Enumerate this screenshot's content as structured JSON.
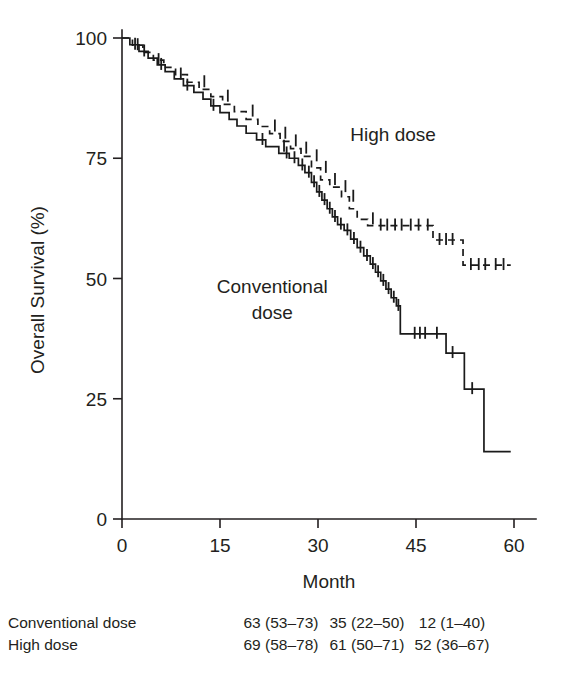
{
  "chart_data": {
    "type": "line",
    "title": "",
    "xlabel": "Month",
    "ylabel": "Overall Survival (%)",
    "xlim": [
      0,
      60
    ],
    "ylim": [
      0,
      100
    ],
    "xticks": [
      0,
      15,
      30,
      45,
      60
    ],
    "xtick_labels": [
      "0",
      "15",
      "30",
      "45",
      "60"
    ],
    "yticks": [
      0,
      25,
      50,
      75,
      100
    ],
    "ytick_labels": [
      "0",
      "25",
      "50",
      "75",
      "100"
    ],
    "grid": false,
    "legend_position": "inline-annotations",
    "annotations": [
      {
        "name": "high-dose-label",
        "text": "High dose",
        "x": 41.5,
        "y": 78.5
      },
      {
        "name": "conventional-dose-label",
        "text": "Conventional",
        "x": 23.0,
        "y": 47.0
      },
      {
        "name": "conventional-dose-label-line2",
        "text": "dose",
        "x": 23.0,
        "y": 41.5
      }
    ],
    "series": [
      {
        "name": "Conventional dose",
        "style": "solid",
        "points": [
          [
            0,
            100
          ],
          [
            1.2,
            100
          ],
          [
            1.2,
            98.6
          ],
          [
            2.6,
            98.6
          ],
          [
            2.6,
            97.2
          ],
          [
            4.0,
            97.2
          ],
          [
            4.0,
            95.8
          ],
          [
            5.4,
            95.8
          ],
          [
            5.4,
            94.4
          ],
          [
            6.6,
            94.4
          ],
          [
            6.6,
            93.0
          ],
          [
            8.0,
            93.0
          ],
          [
            8.0,
            91.5
          ],
          [
            9.4,
            91.5
          ],
          [
            9.4,
            90.1
          ],
          [
            11.0,
            90.1
          ],
          [
            11.0,
            88.7
          ],
          [
            12.4,
            88.7
          ],
          [
            12.4,
            87.3
          ],
          [
            13.6,
            87.3
          ],
          [
            13.6,
            85.9
          ],
          [
            15.0,
            85.9
          ],
          [
            15.0,
            84.5
          ],
          [
            16.4,
            84.5
          ],
          [
            16.4,
            83.1
          ],
          [
            17.6,
            83.1
          ],
          [
            17.6,
            81.7
          ],
          [
            19.0,
            81.7
          ],
          [
            19.0,
            80.2
          ],
          [
            20.6,
            80.2
          ],
          [
            20.6,
            78.8
          ],
          [
            22.0,
            78.8
          ],
          [
            22.0,
            77.4
          ],
          [
            24.0,
            77.4
          ],
          [
            24.0,
            76.0
          ],
          [
            25.6,
            76.0
          ],
          [
            25.6,
            75.0
          ],
          [
            27.0,
            75.0
          ],
          [
            27.0,
            73.5
          ],
          [
            28.0,
            73.5
          ],
          [
            28.0,
            72.0
          ],
          [
            29.0,
            72.0
          ],
          [
            29.0,
            70.0
          ],
          [
            29.8,
            70.0
          ],
          [
            29.8,
            68.0
          ],
          [
            30.6,
            68.0
          ],
          [
            30.6,
            66.3
          ],
          [
            31.4,
            66.3
          ],
          [
            31.4,
            64.5
          ],
          [
            32.2,
            64.5
          ],
          [
            32.2,
            62.8
          ],
          [
            33.0,
            62.8
          ],
          [
            33.0,
            61.2
          ],
          [
            34.0,
            61.2
          ],
          [
            34.0,
            60.0
          ],
          [
            35.0,
            60.0
          ],
          [
            35.0,
            58.2
          ],
          [
            36.0,
            58.2
          ],
          [
            36.0,
            56.4
          ],
          [
            37.0,
            56.4
          ],
          [
            37.0,
            54.7
          ],
          [
            38.0,
            54.7
          ],
          [
            38.0,
            53.0
          ],
          [
            38.8,
            53.0
          ],
          [
            38.8,
            51.3
          ],
          [
            39.6,
            51.3
          ],
          [
            39.6,
            49.5
          ],
          [
            40.4,
            49.5
          ],
          [
            40.4,
            47.8
          ],
          [
            41.2,
            47.8
          ],
          [
            41.2,
            46.0
          ],
          [
            42.0,
            46.0
          ],
          [
            42.0,
            44.3
          ],
          [
            42.6,
            44.3
          ],
          [
            42.6,
            38.5
          ],
          [
            49.6,
            38.5
          ],
          [
            49.6,
            34.5
          ],
          [
            52.4,
            34.5
          ],
          [
            52.4,
            27.0
          ],
          [
            55.4,
            27.0
          ],
          [
            55.4,
            14.0
          ],
          [
            59.5,
            14.0
          ]
        ],
        "censored": [
          [
            2.0,
            98.6
          ],
          [
            3.4,
            97.2
          ],
          [
            6.0,
            94.4
          ],
          [
            10.0,
            90.1
          ],
          [
            14.0,
            85.9
          ],
          [
            21.5,
            78.8
          ],
          [
            24.8,
            77.4
          ],
          [
            25.2,
            76.0
          ],
          [
            26.4,
            75.0
          ],
          [
            27.6,
            73.5
          ],
          [
            28.6,
            72.0
          ],
          [
            29.4,
            70.0
          ],
          [
            30.2,
            68.0
          ],
          [
            31.0,
            66.3
          ],
          [
            31.8,
            64.5
          ],
          [
            32.6,
            62.8
          ],
          [
            33.5,
            61.2
          ],
          [
            34.5,
            60.0
          ],
          [
            35.5,
            58.2
          ],
          [
            36.5,
            56.4
          ],
          [
            37.5,
            54.7
          ],
          [
            38.4,
            53.0
          ],
          [
            39.2,
            51.3
          ],
          [
            40.0,
            49.5
          ],
          [
            40.8,
            47.8
          ],
          [
            41.6,
            46.0
          ],
          [
            42.3,
            44.3
          ],
          [
            44.8,
            38.5
          ],
          [
            45.6,
            38.5
          ],
          [
            46.4,
            38.5
          ],
          [
            48.2,
            38.5
          ],
          [
            50.6,
            34.5
          ],
          [
            53.6,
            27.0
          ]
        ]
      },
      {
        "name": "High dose",
        "style": "dashed",
        "points": [
          [
            0,
            100
          ],
          [
            1.6,
            100
          ],
          [
            1.6,
            98.5
          ],
          [
            3.2,
            98.5
          ],
          [
            3.2,
            97.0
          ],
          [
            4.8,
            97.0
          ],
          [
            4.8,
            95.4
          ],
          [
            6.4,
            95.4
          ],
          [
            6.4,
            93.9
          ],
          [
            8.2,
            93.9
          ],
          [
            8.2,
            92.4
          ],
          [
            10.0,
            92.4
          ],
          [
            10.0,
            90.8
          ],
          [
            11.8,
            90.8
          ],
          [
            11.8,
            89.3
          ],
          [
            13.6,
            89.3
          ],
          [
            13.6,
            87.8
          ],
          [
            15.4,
            87.8
          ],
          [
            15.4,
            86.2
          ],
          [
            17.2,
            86.2
          ],
          [
            17.2,
            84.7
          ],
          [
            19.0,
            84.7
          ],
          [
            19.0,
            83.1
          ],
          [
            20.8,
            83.1
          ],
          [
            20.8,
            81.6
          ],
          [
            22.6,
            81.6
          ],
          [
            22.6,
            80.1
          ],
          [
            24.2,
            80.1
          ],
          [
            24.2,
            78.5
          ],
          [
            25.8,
            78.5
          ],
          [
            25.8,
            77.0
          ],
          [
            27.4,
            77.0
          ],
          [
            27.4,
            75.4
          ],
          [
            29.0,
            75.4
          ],
          [
            29.0,
            73.0
          ],
          [
            30.4,
            73.0
          ],
          [
            30.4,
            70.5
          ],
          [
            31.8,
            70.5
          ],
          [
            31.8,
            69.0
          ],
          [
            33.6,
            69.0
          ],
          [
            33.6,
            67.0
          ],
          [
            34.8,
            67.0
          ],
          [
            34.8,
            64.5
          ],
          [
            36.0,
            64.5
          ],
          [
            36.0,
            62.3
          ],
          [
            37.6,
            62.3
          ],
          [
            37.6,
            61.0
          ],
          [
            47.6,
            61.0
          ],
          [
            47.6,
            58.0
          ],
          [
            52.2,
            58.0
          ],
          [
            52.2,
            52.8
          ],
          [
            59.5,
            52.8
          ]
        ],
        "censored": [
          [
            2.4,
            98.5
          ],
          [
            5.6,
            95.4
          ],
          [
            9.0,
            92.4
          ],
          [
            12.6,
            90.8
          ],
          [
            16.2,
            87.8
          ],
          [
            20.0,
            84.7
          ],
          [
            23.4,
            81.6
          ],
          [
            25.0,
            80.1
          ],
          [
            26.6,
            78.5
          ],
          [
            28.2,
            77.0
          ],
          [
            29.8,
            75.4
          ],
          [
            31.2,
            73.0
          ],
          [
            32.6,
            70.5
          ],
          [
            34.2,
            69.0
          ],
          [
            35.4,
            67.0
          ],
          [
            38.4,
            62.3
          ],
          [
            39.6,
            61.0
          ],
          [
            40.6,
            61.0
          ],
          [
            41.8,
            61.0
          ],
          [
            42.8,
            61.0
          ],
          [
            44.2,
            61.0
          ],
          [
            45.4,
            61.0
          ],
          [
            46.8,
            61.0
          ],
          [
            48.6,
            58.0
          ],
          [
            49.6,
            58.0
          ],
          [
            50.6,
            58.0
          ],
          [
            53.4,
            52.8
          ],
          [
            54.6,
            52.8
          ],
          [
            55.6,
            52.8
          ],
          [
            57.2,
            52.8
          ],
          [
            58.4,
            52.8
          ]
        ]
      }
    ]
  },
  "risk_table": {
    "rows": [
      {
        "label": "Conventional dose",
        "values": [
          "63 (53–73)",
          "35 (22–50)",
          "12 (1–40)"
        ]
      },
      {
        "label": "High dose",
        "values": [
          "69 (58–78)",
          "61 (50–71)",
          "52 (36–67)"
        ]
      }
    ]
  }
}
